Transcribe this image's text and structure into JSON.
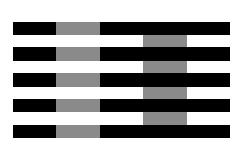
{
  "figure": {
    "name": "White's illusion",
    "colors": {
      "background": "#ffffff",
      "bar": "#000000",
      "gray": "#8a8a8a"
    },
    "bars": [
      {
        "y": 22,
        "h": 13
      },
      {
        "y": 47,
        "h": 14
      },
      {
        "y": 73,
        "h": 14
      },
      {
        "y": 99,
        "h": 13
      },
      {
        "y": 125,
        "h": 13
      }
    ],
    "bar_x": [
      13,
      230
    ],
    "left_gray_x": [
      56,
      100
    ],
    "right_gray_x": [
      143,
      187
    ]
  }
}
